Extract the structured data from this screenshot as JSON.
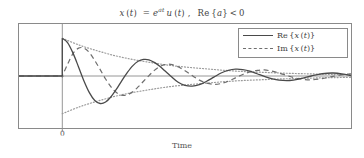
{
  "chart_data": {
    "type": "line",
    "title_parts": {
      "lhs_var": "x",
      "lhs_arg": "(t)",
      "equals": "=",
      "exp_base": "e",
      "exp_power": "at",
      "step": "u",
      "step_arg": "(t)",
      "comma": ",",
      "condition": "Re {a} < 0"
    },
    "xlabel": "Time",
    "ylabel": "",
    "xticks": [
      "0"
    ],
    "xtick_positions": [
      0
    ],
    "yticks": [],
    "grid": false,
    "legend_position": "upper right",
    "xlim": [
      -1.2,
      8.0
    ],
    "ylim": [
      -1.38,
      1.38
    ],
    "decay_rate_a": -0.42,
    "angular_frequency": 2.35,
    "series": [
      {
        "name": "Re {x (t)}",
        "label_math": "Re {x (t)}",
        "style": "solid",
        "color": "#4a4a4a",
        "formula": "e^{at} cos(wt) u(t)",
        "x": [
          -1.2,
          -0.9,
          -0.6,
          -0.3,
          -0.001,
          0,
          0.15,
          0.3,
          0.45,
          0.6,
          0.75,
          0.9,
          1.05,
          1.2,
          1.35,
          1.5,
          1.65,
          1.8,
          1.95,
          2.1,
          2.25,
          2.4,
          2.55,
          2.7,
          2.85,
          3.0,
          3.2,
          3.4,
          3.6,
          3.8,
          4.0,
          4.2,
          4.4,
          4.6,
          4.8,
          5.0,
          5.2,
          5.4,
          5.6,
          5.8,
          6.0,
          6.3,
          6.6,
          6.9,
          7.2,
          7.5,
          7.8,
          8.0
        ],
        "y": [
          0,
          0,
          0,
          0,
          0,
          1.0,
          0.88,
          0.6,
          0.24,
          -0.13,
          -0.44,
          -0.65,
          -0.73,
          -0.69,
          -0.55,
          -0.35,
          -0.12,
          0.09,
          0.27,
          0.39,
          0.44,
          0.43,
          0.36,
          0.26,
          0.13,
          0.0,
          -0.16,
          -0.25,
          -0.27,
          -0.23,
          -0.14,
          -0.03,
          0.08,
          0.15,
          0.18,
          0.17,
          0.13,
          0.06,
          -0.01,
          -0.07,
          -0.11,
          -0.12,
          -0.07,
          0.0,
          0.06,
          0.08,
          0.05,
          0.01
        ]
      },
      {
        "name": "Im {x (t)}",
        "label_math": "Im {x (t)}",
        "style": "dashed",
        "color": "#6e6e6e",
        "formula": "e^{at} sin(wt) u(t)",
        "x": [
          -1.2,
          -0.9,
          -0.6,
          -0.3,
          -0.001,
          0,
          0.15,
          0.3,
          0.45,
          0.6,
          0.75,
          0.9,
          1.05,
          1.2,
          1.35,
          1.5,
          1.65,
          1.8,
          1.95,
          2.1,
          2.25,
          2.4,
          2.55,
          2.7,
          2.85,
          3.0,
          3.2,
          3.4,
          3.6,
          3.8,
          4.0,
          4.2,
          4.4,
          4.6,
          4.8,
          5.0,
          5.2,
          5.4,
          5.6,
          5.8,
          6.0,
          6.3,
          6.6,
          6.9,
          7.2,
          7.5,
          7.8,
          8.0
        ],
        "y": [
          0,
          0,
          0,
          0,
          0,
          0,
          0.32,
          0.6,
          0.74,
          0.74,
          0.62,
          0.41,
          0.17,
          -0.08,
          -0.29,
          -0.44,
          -0.51,
          -0.5,
          -0.42,
          -0.29,
          -0.14,
          0.01,
          0.15,
          0.25,
          0.3,
          0.31,
          0.25,
          0.14,
          0.01,
          -0.11,
          -0.19,
          -0.22,
          -0.2,
          -0.14,
          -0.05,
          0.04,
          0.11,
          0.15,
          0.16,
          0.13,
          0.08,
          -0.01,
          -0.08,
          -0.1,
          -0.07,
          -0.01,
          0.04,
          0.06
        ]
      },
      {
        "name": "upper envelope",
        "label_math": "",
        "style": "dotted",
        "color": "#9a9a9a",
        "formula": "+e^{at} u(t)",
        "x": [
          0,
          0.5,
          1.0,
          1.5,
          2.0,
          2.5,
          3.0,
          3.5,
          4.0,
          4.5,
          5.0,
          5.5,
          6.0,
          6.5,
          7.0,
          7.5,
          8.0
        ],
        "y": [
          1.0,
          0.81,
          0.66,
          0.53,
          0.43,
          0.35,
          0.28,
          0.23,
          0.19,
          0.15,
          0.12,
          0.1,
          0.08,
          0.065,
          0.053,
          0.043,
          0.035
        ]
      },
      {
        "name": "lower envelope",
        "label_math": "",
        "style": "dotted",
        "color": "#9a9a9a",
        "formula": "-e^{at} u(t)",
        "x": [
          0,
          0.5,
          1.0,
          1.5,
          2.0,
          2.5,
          3.0,
          3.5,
          4.0,
          4.5,
          5.0,
          5.5,
          6.0,
          6.5,
          7.0,
          7.5,
          8.0
        ],
        "y": [
          -1.0,
          -0.81,
          -0.66,
          -0.53,
          -0.43,
          -0.35,
          -0.28,
          -0.23,
          -0.19,
          -0.15,
          -0.12,
          -0.1,
          -0.08,
          -0.065,
          -0.053,
          -0.043,
          -0.035
        ]
      }
    ],
    "legend_entries": [
      {
        "label": "Re {x (t)}",
        "style": "solid"
      },
      {
        "label": "Im {x (t)}",
        "style": "dashed"
      }
    ],
    "axes_color": "#8a8a8a",
    "text_color": "#4a4a4a"
  },
  "legend": {
    "re_prefix": "Re",
    "re_body": "{x (t)}",
    "im_prefix": "Im",
    "im_body": "{x (t)}"
  },
  "axis": {
    "xlabel": "Time",
    "tick_zero": "0"
  }
}
